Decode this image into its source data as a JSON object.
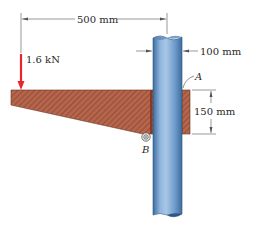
{
  "diagram": {
    "dimensions": {
      "horizontal": "500 mm",
      "pipe_diameter": "100 mm",
      "bracket_height": "150 mm"
    },
    "load": {
      "label": "1.6 kN",
      "color": "#e8262b"
    },
    "points": {
      "a": "A",
      "b": "B"
    },
    "colors": {
      "bracket": "#b5654b",
      "bracket_hatch": "#7d3b28",
      "pipe_light": "#a9c7e6",
      "pipe_mid": "#6f9ccc",
      "pipe_dark": "#3e6d9f",
      "dimension_line": "#555555"
    }
  }
}
